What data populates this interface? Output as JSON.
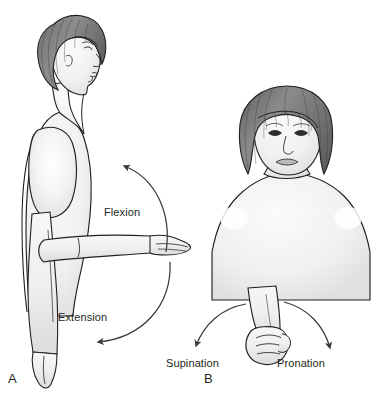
{
  "figure": {
    "background_color": "#ffffff",
    "ink_color": "#231f20",
    "skin_fill": "#f2f2f2",
    "hair_fill": "#8a8a8a",
    "hair_dark": "#5f5f5f",
    "width": 392,
    "height": 402
  },
  "panels": [
    {
      "letter": "A",
      "name": "shoulder-flexion-extension",
      "view": "lateral profile, facing right",
      "labels": [
        {
          "id": "flexion",
          "text": "Flexion",
          "x": 104,
          "y": 206
        },
        {
          "id": "extension",
          "text": "Extension",
          "x": 58,
          "y": 311
        }
      ],
      "arrows": [
        {
          "id": "flexion-arc",
          "direction": "counterclockwise-up",
          "arrowhead": "up-left"
        },
        {
          "id": "extension-arc",
          "direction": "counterclockwise-back",
          "arrowhead": "left"
        }
      ],
      "arm_position": "right arm extended horizontally forward"
    },
    {
      "letter": "B",
      "name": "forearm-supination-pronation",
      "view": "anterior frontal",
      "labels": [
        {
          "id": "supination",
          "text": "Supination",
          "x": 166,
          "y": 357
        },
        {
          "id": "pronation",
          "text": "Pronation",
          "x": 277,
          "y": 357
        }
      ],
      "arrows": [
        {
          "id": "supination-arc",
          "direction": "left-downward",
          "arrowhead": "down"
        },
        {
          "id": "pronation-arc",
          "direction": "right-downward",
          "arrowhead": "down"
        }
      ],
      "arm_position": "forearm flexed, hand in fist"
    }
  ],
  "labels": {
    "flexion": "Flexion",
    "extension": "Extension",
    "supination": "Supination",
    "pronation": "Pronation",
    "letter_a": "A",
    "letter_b": "B"
  }
}
